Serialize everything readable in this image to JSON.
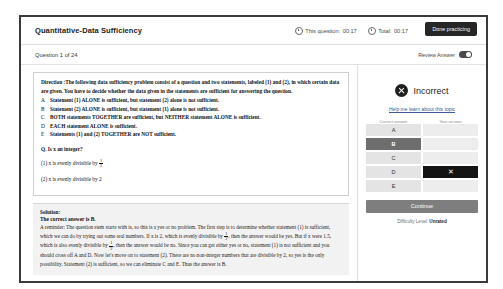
{
  "header": {
    "title": "Quantitative-Data Sufficiency",
    "timers": [
      {
        "icon": "clock-icon",
        "label": "This question:",
        "value": "00:17"
      },
      {
        "icon": "clock-icon",
        "label": "Total:",
        "value": "00:17"
      }
    ],
    "done_button": "Done practicing"
  },
  "subheader": {
    "question_counter": "Question 1 of 24",
    "review_label": "Review Answer",
    "review_toggle_state": "on"
  },
  "question": {
    "direction_label": "Direction :",
    "direction_text": "The following data sufficiency problem consist of a question and two statements, labeled (1) and (2), in which certain data are given. You have to decide whether the data given in the statements are sufficient for answering the question.",
    "choices": [
      {
        "letter": "A",
        "text": "Statement (1) ALONE is sufficient, but statement (2) alone is not sufficient."
      },
      {
        "letter": "B",
        "text": "Statement (2) ALONE is sufficient, but statement (1) alone is not sufficient."
      },
      {
        "letter": "C",
        "text": "BOTH statements TOGETHER are sufficient, but NEITHER statement ALONE is sufficient."
      },
      {
        "letter": "D",
        "text": "EACH statement ALONE is sufficient."
      },
      {
        "letter": "E",
        "text": "Statements (1) and (2) TOGETHER are NOT sufficient."
      }
    ],
    "stem": "Q. Is x an integer?",
    "statement_1_prefix": "(1) x is evenly divisible by",
    "statement_1_fraction_num": "1",
    "statement_1_fraction_den": "2",
    "statement_2": "(2) x is evenly divisible by 2"
  },
  "solution": {
    "title": "Solution:",
    "answer_line": "The correct answer is B.",
    "body_part_1": "A reminder: The question stem starts with is, so this is a yes or no problem. The first step is to determine whether statement (1) is sufficient, which we can do by trying out some real numbers. If x is 2, which is evenly divisible by",
    "fraction_num": "1",
    "fraction_den": "2",
    "body_part_2": ", then the answer would be yes. But if x were 1.5, which is also evenly divisible by",
    "body_part_3": ", then the answer would be no. Since you can get either yes or no, statement (1) is not sufficient and you should cross off A and D. Now let's move on to statement (2). There are no non-integer numbers that are divisible by 2, so yes is the only possibility. Statement (2) is sufficient, so we can eliminate C and E. Thus the answer is B."
  },
  "result_panel": {
    "status": "Incorrect",
    "status_icon": "x-circle-icon",
    "help_link": "Help me learn about this topic",
    "column_headers": [
      "Correct answer",
      "Your answer"
    ],
    "options": [
      {
        "letter": "A",
        "is_correct": false,
        "is_your_answer": false
      },
      {
        "letter": "B",
        "is_correct": true,
        "is_your_answer": false
      },
      {
        "letter": "C",
        "is_correct": false,
        "is_your_answer": false
      },
      {
        "letter": "D",
        "is_correct": false,
        "is_your_answer": true
      },
      {
        "letter": "E",
        "is_correct": false,
        "is_your_answer": false
      }
    ],
    "your_answer_mark": "✕",
    "continue_button": "Continue",
    "difficulty_label": "Difficulty Level:",
    "difficulty_value": "Unrated"
  },
  "colors": {
    "window_border": "#3a3a3a",
    "dark_button": "#262626",
    "correct_option": "#6e6e6e",
    "your_answer": "#141414",
    "option_bg": "#e4e4e4",
    "continue_bg": "#7e7e7e",
    "link": "#3b5c96"
  }
}
